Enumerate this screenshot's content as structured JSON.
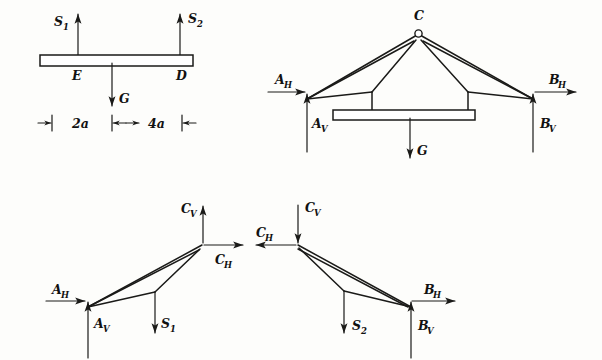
{
  "figure": {
    "panels": [
      {
        "id": "panel-1",
        "name": "suspended-beam-free-body",
        "description": "Suspended platform beam with hanger forces S1, S2 and weight G",
        "labels": [
          {
            "key": "s1",
            "text": "S",
            "sub": "1"
          },
          {
            "key": "s2",
            "text": "S",
            "sub": "2"
          },
          {
            "key": "point_e",
            "text": "E",
            "sub": ""
          },
          {
            "key": "point_d",
            "text": "D",
            "sub": ""
          },
          {
            "key": "weight_g",
            "text": "G",
            "sub": ""
          }
        ],
        "dimensions": [
          {
            "key": "dim_left",
            "text": "2a"
          },
          {
            "key": "dim_right",
            "text": "4a"
          }
        ]
      },
      {
        "id": "panel-2",
        "name": "whole-truss-free-body",
        "description": "Complete truss with apex pin C, supports A and B, platform loaded by G",
        "labels": [
          {
            "key": "apex_c",
            "text": "C",
            "sub": ""
          },
          {
            "key": "a_h",
            "text": "A",
            "sub": "H"
          },
          {
            "key": "a_v",
            "text": "A",
            "sub": "V"
          },
          {
            "key": "b_h",
            "text": "B",
            "sub": "H"
          },
          {
            "key": "b_v",
            "text": "B",
            "sub": "V"
          },
          {
            "key": "weight_g",
            "text": "G",
            "sub": ""
          }
        ]
      },
      {
        "id": "panel-3",
        "name": "left-half-free-body",
        "description": "Left half truss free body: reactions at A, pin forces at C, hanger force S1",
        "labels": [
          {
            "key": "c_v",
            "text": "C",
            "sub": "V"
          },
          {
            "key": "c_h",
            "text": "C",
            "sub": "H"
          },
          {
            "key": "a_h",
            "text": "A",
            "sub": "H"
          },
          {
            "key": "a_v",
            "text": "A",
            "sub": "V"
          },
          {
            "key": "s1",
            "text": "S",
            "sub": "1"
          }
        ]
      },
      {
        "id": "panel-4",
        "name": "right-half-free-body",
        "description": "Right half truss free body: pin forces at C, hanger force S2, reactions at B",
        "labels": [
          {
            "key": "c_v",
            "text": "C",
            "sub": "V"
          },
          {
            "key": "c_h",
            "text": "C",
            "sub": "H"
          },
          {
            "key": "s2",
            "text": "S",
            "sub": "2"
          },
          {
            "key": "b_h",
            "text": "B",
            "sub": "H"
          },
          {
            "key": "b_v",
            "text": "B",
            "sub": "V"
          }
        ]
      }
    ],
    "colors": {
      "ink": "#1a1a18",
      "paper": "#fdfdfb"
    }
  }
}
